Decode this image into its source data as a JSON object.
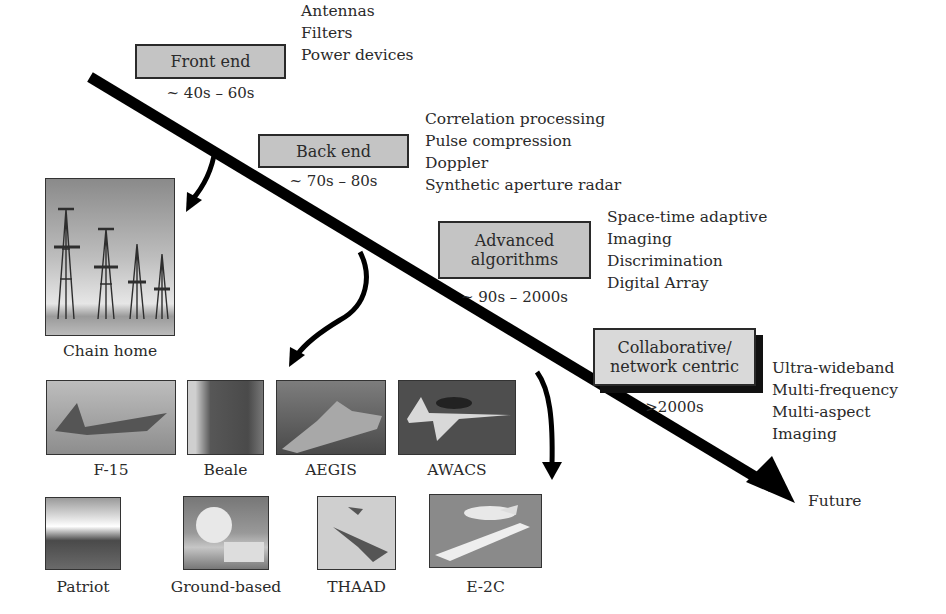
{
  "eras": [
    {
      "label": "Front end",
      "date": "~ 40s – 60s",
      "items": [
        "Antennas",
        "Filters",
        "Power devices"
      ]
    },
    {
      "label": "Back end",
      "date": "~ 70s – 80s",
      "items": [
        "Correlation processing",
        "Pulse compression",
        "Doppler",
        "Synthetic aperture radar"
      ]
    },
    {
      "label": "Advanced algorithms",
      "label_lines": [
        "Advanced",
        "algorithms"
      ],
      "date": "~ 90s – 2000s",
      "items": [
        "Space-time adaptive",
        "Imaging",
        "Discrimination",
        "Digital Array"
      ]
    },
    {
      "label": "Collaborative/ network centric",
      "label_lines": [
        "Collaborative/",
        "network centric"
      ],
      "date": ">2000s",
      "items": [
        "Ultra-wideband",
        "Multi-frequency",
        "Multi-aspect",
        "Imaging"
      ]
    }
  ],
  "timeline": {
    "end_label": "Future"
  },
  "systems": {
    "chain_home": "Chain home",
    "row1": [
      "F-15",
      "Beale",
      "AEGIS",
      "AWACS"
    ],
    "row2": [
      "Patriot",
      "Ground-based",
      "THAAD",
      "E-2C"
    ]
  },
  "colors": {
    "box_fill": "#c4c4c4",
    "box_fill_light": "#d9d9d9",
    "line": "#000000",
    "text": "#2a2a2a"
  }
}
